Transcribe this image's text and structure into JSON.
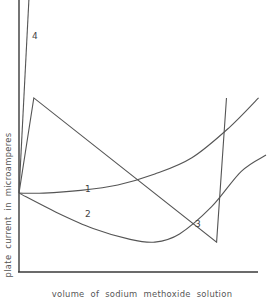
{
  "chart_data": {
    "type": "line",
    "title": "",
    "xlabel": "volume of sodium methoxide solution",
    "ylabel": "plate current in microamperes",
    "xlim": [
      0,
      100
    ],
    "ylim": [
      0,
      100
    ],
    "grid": false,
    "legend": "none (curves labelled inline)",
    "axis_ticks": "none",
    "series": [
      {
        "name": "1",
        "points": [
          [
            0,
            29
          ],
          [
            10,
            29
          ],
          [
            25,
            30
          ],
          [
            40,
            32
          ],
          [
            55,
            36
          ],
          [
            70,
            42
          ],
          [
            85,
            53
          ],
          [
            97,
            64
          ]
        ]
      },
      {
        "name": "2",
        "points": [
          [
            0,
            29
          ],
          [
            15,
            22
          ],
          [
            30,
            16
          ],
          [
            45,
            12
          ],
          [
            55,
            11
          ],
          [
            65,
            14
          ],
          [
            78,
            24
          ],
          [
            90,
            37
          ],
          [
            100,
            43
          ]
        ]
      },
      {
        "name": "3",
        "points": [
          [
            0,
            29
          ],
          [
            6,
            64
          ],
          [
            80,
            11
          ],
          [
            84,
            64
          ]
        ]
      },
      {
        "name": "4",
        "points": [
          [
            0,
            29
          ],
          [
            4,
            100
          ]
        ]
      }
    ],
    "labels": [
      {
        "text": "1",
        "series": "1"
      },
      {
        "text": "2",
        "series": "2"
      },
      {
        "text": "3",
        "series": "3"
      },
      {
        "text": "4",
        "series": "4"
      }
    ]
  }
}
